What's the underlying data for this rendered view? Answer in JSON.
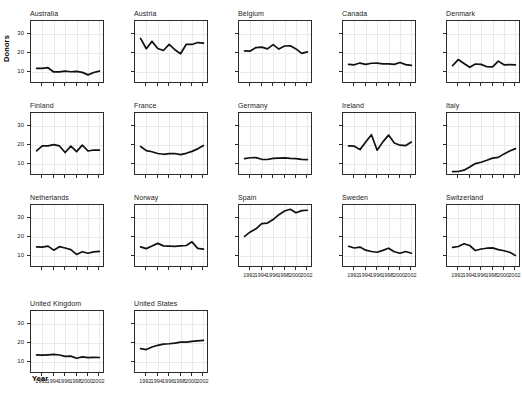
{
  "chart_data": {
    "type": "line",
    "title": "",
    "xlabel": "Year",
    "ylabel": "Donors",
    "xlim": [
      1990.2,
      2002.8
    ],
    "ylim": [
      4.5,
      36
    ],
    "yticks": [
      10,
      20,
      30
    ],
    "xticks": [
      1992,
      1994,
      1996,
      1998,
      2000,
      2002
    ],
    "xtick_labels": [
      "1992",
      "1994",
      "1996",
      "1998",
      "2000",
      "2002"
    ],
    "ytick_labels": [
      "10",
      "20",
      "30"
    ],
    "grid": true,
    "legend": "none",
    "layout": {
      "rows": 4,
      "cols": 5,
      "panel_order": "row-major"
    },
    "x": [
      1991,
      1992,
      1993,
      1994,
      1995,
      1996,
      1997,
      1998,
      1999,
      2000,
      2001,
      2002
    ],
    "panels": [
      {
        "name": "Australia",
        "values": [
          12.1,
          12.1,
          12.4,
          10.2,
          10.2,
          10.6,
          10.3,
          10.5,
          10.0,
          8.7,
          9.9,
          10.6
        ]
      },
      {
        "name": "Austria",
        "values": [
          27.5,
          22.2,
          26.0,
          22.3,
          21.3,
          24.4,
          21.7,
          19.6,
          24.5,
          24.4,
          25.4,
          25.1
        ]
      },
      {
        "name": "Belgium",
        "values": [
          21.1,
          21.0,
          22.8,
          23.0,
          22.1,
          24.3,
          22.0,
          23.6,
          23.7,
          22.1,
          19.8,
          20.6
        ]
      },
      {
        "name": "Canada",
        "values": [
          14.1,
          13.9,
          14.8,
          14.1,
          14.7,
          14.8,
          14.4,
          14.4,
          14.1,
          15.1,
          14.0,
          13.6
        ]
      },
      {
        "name": "Denmark",
        "values": [
          13.5,
          16.6,
          14.6,
          12.6,
          14.3,
          14.1,
          12.9,
          12.8,
          15.8,
          13.9,
          14.0,
          13.9
        ]
      },
      {
        "name": "Finland",
        "values": [
          17.0,
          19.5,
          19.5,
          20.2,
          19.5,
          16.1,
          19.4,
          16.6,
          19.9,
          16.9,
          17.4,
          17.3
        ]
      },
      {
        "name": "France",
        "values": [
          19.2,
          17.1,
          16.5,
          15.6,
          15.2,
          15.5,
          15.6,
          15.0,
          15.7,
          16.7,
          18.0,
          19.7
        ]
      },
      {
        "name": "Germany",
        "values": [
          13.0,
          13.4,
          13.5,
          12.6,
          12.5,
          13.1,
          13.2,
          13.3,
          13.1,
          13.0,
          12.6,
          12.4
        ]
      },
      {
        "name": "Ireland",
        "values": [
          19.5,
          19.4,
          17.6,
          21.5,
          25.3,
          17.3,
          21.6,
          25.1,
          21.0,
          19.9,
          19.7,
          21.5
        ]
      },
      {
        "name": "Italy",
        "values": [
          6.2,
          6.3,
          7.0,
          8.6,
          10.4,
          11.1,
          12.1,
          13.2,
          13.6,
          15.4,
          16.9,
          18.1
        ]
      },
      {
        "name": "Netherlands",
        "values": [
          14.9,
          14.8,
          15.3,
          13.2,
          15.0,
          14.3,
          13.5,
          11.0,
          12.4,
          11.6,
          12.3,
          12.6
        ]
      },
      {
        "name": "Norway",
        "values": [
          14.9,
          14.0,
          15.3,
          16.7,
          15.4,
          15.3,
          15.2,
          15.4,
          15.6,
          17.5,
          14.1,
          13.7
        ]
      },
      {
        "name": "Spain",
        "values": [
          20.3,
          22.6,
          24.2,
          26.9,
          27.2,
          29.0,
          31.5,
          33.4,
          34.3,
          32.5,
          33.6,
          33.8
        ]
      },
      {
        "name": "Sweden",
        "values": [
          15.2,
          14.3,
          14.8,
          13.2,
          12.5,
          12.1,
          13.1,
          14.2,
          12.4,
          11.6,
          12.5,
          11.6
        ]
      },
      {
        "name": "Switzerland",
        "values": [
          14.6,
          15.1,
          16.5,
          15.6,
          13.0,
          13.8,
          14.2,
          14.4,
          13.5,
          12.9,
          12.1,
          10.5
        ]
      },
      {
        "name": "United Kingdom",
        "values": [
          13.9,
          13.7,
          13.9,
          14.1,
          13.8,
          13.1,
          13.2,
          12.1,
          12.8,
          12.4,
          12.6,
          12.5
        ]
      },
      {
        "name": "United States",
        "values": [
          17.1,
          16.6,
          17.9,
          18.8,
          19.4,
          19.6,
          19.9,
          20.4,
          20.4,
          20.8,
          21.1,
          21.3
        ]
      }
    ]
  }
}
